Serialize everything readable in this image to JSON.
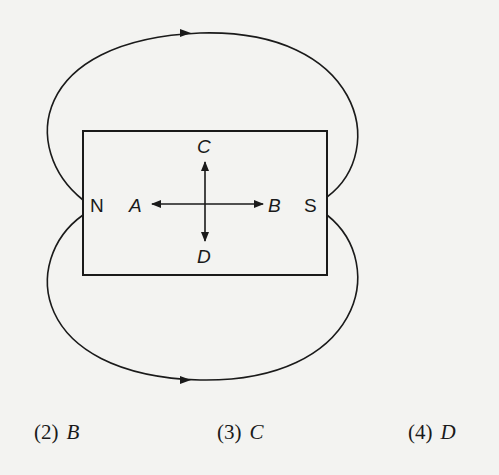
{
  "diagram": {
    "magnet": {
      "north_label": "N",
      "south_label": "S"
    },
    "points": {
      "A": "A",
      "B": "B",
      "C": "C",
      "D": "D"
    },
    "field_lines": [
      "top loop from N to S",
      "bottom loop from N to S"
    ]
  },
  "options": [
    {
      "number": "(2)",
      "value": "B"
    },
    {
      "number": "(3)",
      "value": "C"
    },
    {
      "number": "(4)",
      "value": "D"
    }
  ],
  "colors": {
    "ink": "#1a1a1a",
    "paper": "#f3f3f1"
  }
}
